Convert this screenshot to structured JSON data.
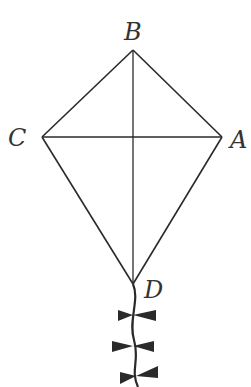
{
  "figure": {
    "type": "kite-geometry",
    "labels": {
      "B": "B",
      "C": "C",
      "A": "A",
      "D": "D"
    },
    "points": {
      "B": [
        133,
        50
      ],
      "C": [
        42,
        137
      ],
      "A": [
        222,
        137
      ],
      "D": [
        133,
        284
      ]
    },
    "segments": [
      [
        "B",
        "C"
      ],
      [
        "B",
        "A"
      ],
      [
        "C",
        "D"
      ],
      [
        "A",
        "D"
      ],
      [
        "B",
        "D"
      ],
      [
        "C",
        "A"
      ]
    ],
    "tail_bows": 3,
    "colors": {
      "line": "#2a2a2a",
      "label": "#333333",
      "background": "#ffffff"
    }
  }
}
